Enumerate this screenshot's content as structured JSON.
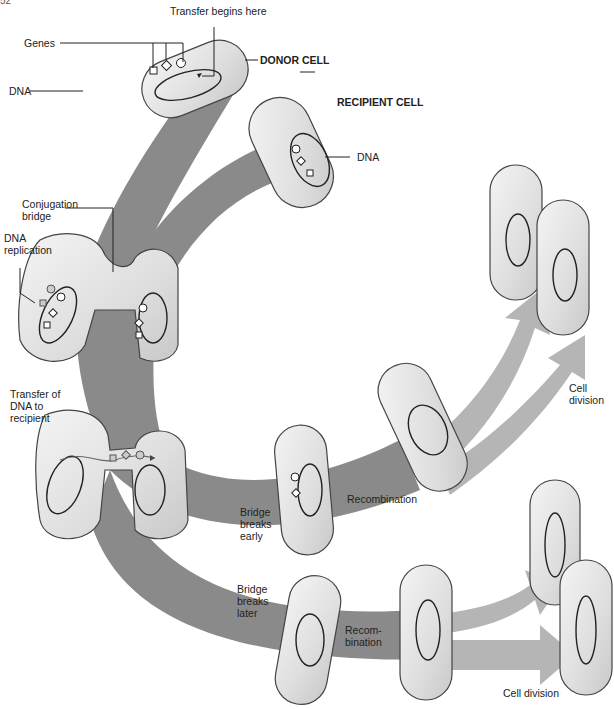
{
  "page_number": "52",
  "labels": {
    "transfer_begins": "Transfer begins here",
    "genes": "Genes",
    "dna_donor": "DNA",
    "donor_cell": "DONOR CELL",
    "recipient_cell": "RECIPIENT CELL",
    "dna_recipient": "DNA",
    "conjugation_bridge": "Conjugation\nbridge",
    "dna_replication": "DNA\nreplication",
    "transfer_of_dna": "Transfer of\nDNA to\nrecipient",
    "bridge_breaks_early": "Bridge\nbreaks\nearly",
    "recombination_1": "Recombination",
    "cell_division_1": "Cell\ndivision",
    "bridge_breaks_later": "Bridge\nbreaks\nlater",
    "recombination_2": "Recom-\nbination",
    "cell_division_2": "Cell division"
  },
  "colors": {
    "arrow": "#8a8a8a",
    "arrow_light": "#b5b5b5",
    "cell_fill": "#e4e4e4",
    "cell_stroke": "#444444",
    "line": "#222222"
  },
  "stages": [
    {
      "name": "donor",
      "genes": [
        "square",
        "diamond",
        "circle"
      ]
    },
    {
      "name": "recipient",
      "genes": [
        "circle",
        "diamond",
        "square"
      ]
    },
    {
      "name": "replication"
    },
    {
      "name": "transfer"
    },
    {
      "name": "early-break-recombination"
    },
    {
      "name": "late-break-recombination"
    },
    {
      "name": "cell-division"
    }
  ]
}
